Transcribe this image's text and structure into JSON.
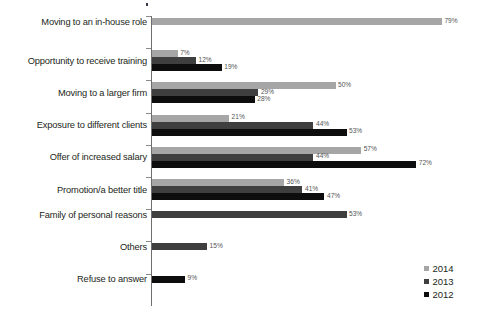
{
  "chart_data": {
    "type": "bar",
    "orientation": "horizontal",
    "title": "",
    "subtitle": "",
    "xlabel": "",
    "ylabel": "",
    "xlim": [
      0,
      79
    ],
    "grid": false,
    "value_suffix": "%",
    "legend_position": "bottom-right",
    "categories": [
      "Moving to an in-house role",
      "Opportunity to receive training",
      "Moving to a larger firm",
      "Exposure to different clients",
      "Offer of increased salary",
      "Promotion/a better title",
      "Family of personal reasons",
      "Others",
      "Refuse to answer"
    ],
    "series": [
      {
        "name": "2014",
        "color": "#a6a6a6",
        "values": [
          79,
          7,
          50,
          21,
          57,
          36,
          null,
          null,
          null
        ]
      },
      {
        "name": "2013",
        "color": "#3f3f3f",
        "values": [
          null,
          12,
          29,
          44,
          44,
          41,
          53,
          15,
          null
        ]
      },
      {
        "name": "2012",
        "color": "#0d0d0d",
        "values": [
          null,
          19,
          28,
          53,
          72,
          47,
          null,
          null,
          9
        ]
      }
    ],
    "labels": [
      {
        "category": "Moving to an in-house role",
        "series": "2014",
        "text": "79%"
      },
      {
        "category": "Opportunity to receive training",
        "series": "2014",
        "text": "7%"
      },
      {
        "category": "Opportunity to receive training",
        "series": "2013",
        "text": "12%"
      },
      {
        "category": "Opportunity to receive training",
        "series": "2012",
        "text": "19%"
      },
      {
        "category": "Moving to a larger firm",
        "series": "2014",
        "text": "50%"
      },
      {
        "category": "Moving to a larger firm",
        "series": "2013",
        "text": "29%"
      },
      {
        "category": "Moving to a larger firm",
        "series": "2012",
        "text": "28%"
      },
      {
        "category": "Exposure to different clients",
        "series": "2014",
        "text": "21%"
      },
      {
        "category": "Exposure to different clients",
        "series": "2013",
        "text": "44%"
      },
      {
        "category": "Exposure to different clients",
        "series": "2012",
        "text": "53%"
      },
      {
        "category": "Offer of increased salary",
        "series": "2014",
        "text": "57%"
      },
      {
        "category": "Offer of increased salary",
        "series": "2013",
        "text": "44%"
      },
      {
        "category": "Offer of increased salary",
        "series": "2012",
        "text": "72%"
      },
      {
        "category": "Promotion/a better title",
        "series": "2014",
        "text": "36%"
      },
      {
        "category": "Promotion/a better title",
        "series": "2013",
        "text": "41%"
      },
      {
        "category": "Promotion/a better title",
        "series": "2012",
        "text": "47%"
      },
      {
        "category": "Family of personal reasons",
        "series": "2013",
        "text": "53%"
      },
      {
        "category": "Others",
        "series": "2013",
        "text": "15%"
      },
      {
        "category": "Refuse to answer",
        "series": "2012",
        "text": "9%"
      }
    ]
  },
  "legend": {
    "items": [
      {
        "label": "2014",
        "color": "#a6a6a6"
      },
      {
        "label": "2013",
        "color": "#3f3f3f"
      },
      {
        "label": "2012",
        "color": "#0d0d0d"
      }
    ]
  },
  "geometry": {
    "axis_x": 152,
    "px_per_unit": 3.67,
    "row_top": 16,
    "row_height": 32.2,
    "bar_height": 7
  }
}
